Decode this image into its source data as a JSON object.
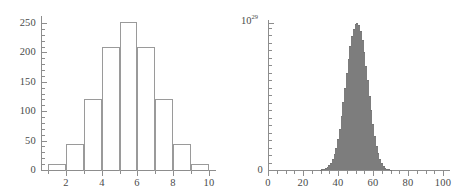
{
  "figure": {
    "background": "#ffffff",
    "panel_count": 2
  },
  "chart_data": [
    {
      "type": "bar",
      "id": "left-histogram",
      "title": "",
      "subtitle": "",
      "xlabel": "",
      "ylabel": "",
      "grid": false,
      "legend": null,
      "bar_style": "outline",
      "outline_color": "#9a9a9a",
      "fill_color": "transparent",
      "axis_color": "#8d8d8d",
      "xlim": [
        0.6,
        10.4
      ],
      "ylim": [
        0,
        262
      ],
      "bin_width": 1,
      "categories": [
        "1",
        "2",
        "3",
        "4",
        "5",
        "6",
        "7",
        "8",
        "9",
        "10"
      ],
      "bin_centers": [
        1.5,
        2.5,
        3.5,
        4.5,
        5.5,
        6.5,
        7.5,
        8.5,
        9.5
      ],
      "bin_edges": [
        1,
        2,
        3,
        4,
        5,
        6,
        7,
        8,
        9,
        10
      ],
      "values": [
        11,
        45,
        120,
        210,
        252,
        210,
        120,
        45,
        11
      ],
      "xticks": [
        2,
        4,
        6,
        8,
        10
      ],
      "xticklabels": [
        "2",
        "4",
        "6",
        "8",
        "10"
      ],
      "x_minor_ticks": [
        1,
        3,
        5,
        7,
        9
      ],
      "yticks": [
        0,
        50,
        100,
        150,
        200,
        250
      ],
      "yticklabels": [
        "0",
        "50",
        "100",
        "150",
        "200",
        "250"
      ],
      "y_minor_ticks": [
        10,
        20,
        30,
        40,
        60,
        70,
        80,
        90,
        110,
        120,
        130,
        140,
        160,
        170,
        180,
        190,
        210,
        220,
        230,
        240
      ]
    },
    {
      "type": "bar",
      "id": "right-histogram",
      "title": "",
      "subtitle": "",
      "xlabel": "",
      "ylabel": "",
      "grid": false,
      "legend": null,
      "bar_style": "filled",
      "outline_color": "#7d7d7d",
      "fill_color": "#b9b9b9",
      "axis_color": "#8d8d8d",
      "y_scale_label": "10",
      "y_scale_exponent": "29",
      "xlim": [
        0,
        104
      ],
      "ylim": [
        0,
        1.02
      ],
      "bin_width": 1,
      "peak_center": 51,
      "xticks": [
        0,
        20,
        40,
        60,
        80,
        100
      ],
      "xticklabels": [
        "0",
        "20",
        "40",
        "60",
        "80",
        "100"
      ],
      "x_minor_ticks": [
        5,
        10,
        15,
        25,
        30,
        35,
        45,
        50,
        55,
        65,
        70,
        75,
        85,
        90,
        95
      ],
      "yticks": [
        0,
        1
      ],
      "yticklabels": [
        "0",
        ""
      ],
      "y_minor_tick_count": 20,
      "x": [
        30,
        31,
        32,
        33,
        34,
        35,
        36,
        37,
        38,
        39,
        40,
        41,
        42,
        43,
        44,
        45,
        46,
        47,
        48,
        49,
        50,
        51,
        52,
        53,
        54,
        55,
        56,
        57,
        58,
        59,
        60,
        61,
        62,
        63,
        64,
        65,
        66,
        67,
        68,
        69,
        70
      ],
      "values": [
        0.003,
        0.005,
        0.008,
        0.013,
        0.021,
        0.033,
        0.05,
        0.075,
        0.108,
        0.152,
        0.209,
        0.28,
        0.365,
        0.46,
        0.56,
        0.66,
        0.755,
        0.84,
        0.91,
        0.96,
        0.99,
        1.0,
        0.985,
        0.945,
        0.885,
        0.805,
        0.71,
        0.61,
        0.505,
        0.405,
        0.312,
        0.232,
        0.166,
        0.114,
        0.075,
        0.047,
        0.028,
        0.016,
        0.009,
        0.005,
        0.002
      ]
    }
  ]
}
